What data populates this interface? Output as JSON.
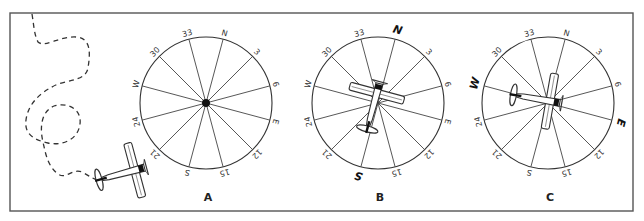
{
  "figure": {
    "frame": {
      "x": 10,
      "y": 13,
      "width": 623,
      "height": 198,
      "stroke": "#555555"
    },
    "ink": "#333333",
    "compass_ticks": [
      "N",
      "3",
      "6",
      "E",
      "12",
      "15",
      "S",
      "21",
      "24",
      "W",
      "30",
      "33"
    ],
    "compass_rotation_deg": 15,
    "panels": [
      {
        "id": "A",
        "label": "A",
        "center": [
          206,
          103
        ],
        "radius": 66,
        "emphasized_ticks": [],
        "center_dot": true,
        "airplane": null
      },
      {
        "id": "B",
        "label": "B",
        "center": [
          378,
          103
        ],
        "radius": 66,
        "emphasized_ticks": [
          "N",
          "S"
        ],
        "center_dot": false,
        "airplane": {
          "x": 375,
          "y": 100,
          "heading_deg": 15,
          "scale": 1.0
        }
      },
      {
        "id": "C",
        "label": "C",
        "center": [
          548,
          103
        ],
        "radius": 66,
        "emphasized_ticks": [
          "W",
          "E"
        ],
        "center_dot": false,
        "airplane": {
          "x": 543,
          "y": 100,
          "heading_deg": 100,
          "scale": 1.0
        }
      }
    ],
    "flight_path": {
      "style": "dashed",
      "d": "M32,14 C34,26 34,34 38,42 C44,48 60,36 76,37 C92,38 90,55 88,68 C86,80 70,80 58,84 C40,92 28,104 26,120 C24,134 34,140 48,143 C62,146 78,140 80,124 C82,108 66,102 54,106 C40,112 40,130 43,142 C46,156 48,166 58,174 C66,180 72,168 82,172 C90,176 96,182 104,180"
    },
    "taxi_airplane": {
      "x": 128,
      "y": 172,
      "heading_deg": 75,
      "scale": 1.0
    }
  }
}
